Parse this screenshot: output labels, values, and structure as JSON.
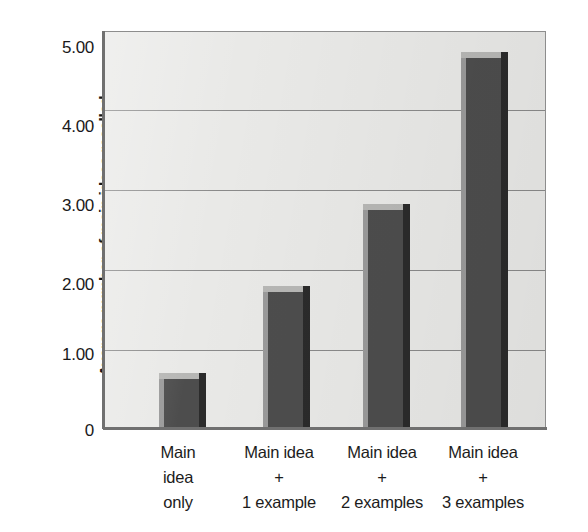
{
  "chart_data": {
    "type": "bar",
    "title": "",
    "subtitle": "",
    "xlabel": "",
    "ylabel": "Average number of main ideas recalled",
    "categories": [
      "Main idea only",
      "Main idea + 1 example",
      "Main idea + 2 examples",
      "Main idea + 3 examples"
    ],
    "category_lines": [
      [
        "Main",
        "idea",
        "only"
      ],
      [
        "Main idea",
        "+",
        "1 example"
      ],
      [
        "Main idea",
        "+",
        "2 examples"
      ],
      [
        "Main idea",
        "+",
        "3 examples"
      ]
    ],
    "values": [
      0.68,
      1.78,
      2.82,
      4.74
    ],
    "ylim": [
      0,
      5
    ],
    "y_ticks": [
      0,
      1,
      2,
      3,
      4,
      5
    ],
    "y_tick_labels": [
      "0",
      "1.00",
      "2.00",
      "3.00",
      "4.00",
      "5.00"
    ],
    "grid": true,
    "legend": "none",
    "colors": {
      "bar_front": "#4d4d4d",
      "bar_top": "#b7b7b5",
      "bar_side_left": "#9a9a9a",
      "bar_side_right": "#2b2b2b",
      "plot_background": "#e9e9e7",
      "gridline": "#8a8a8a",
      "axis": "#707070",
      "text": "#1a1a1a"
    }
  },
  "axis": {
    "y_title": "Average number of main ideas recalled",
    "y_labels": {
      "t5": "5.00",
      "t4": "4.00",
      "t3": "3.00",
      "t2": "2.00",
      "t1": "1.00",
      "t0": "0"
    },
    "x_labels": [
      {
        "l1": "Main",
        "l2": "idea",
        "l3": "only"
      },
      {
        "l1": "Main idea",
        "l2": "+",
        "l3": "1 example"
      },
      {
        "l1": "Main idea",
        "l2": "+",
        "l3": "2 examples"
      },
      {
        "l1": "Main idea",
        "l2": "+",
        "l3": "3 examples"
      }
    ]
  }
}
